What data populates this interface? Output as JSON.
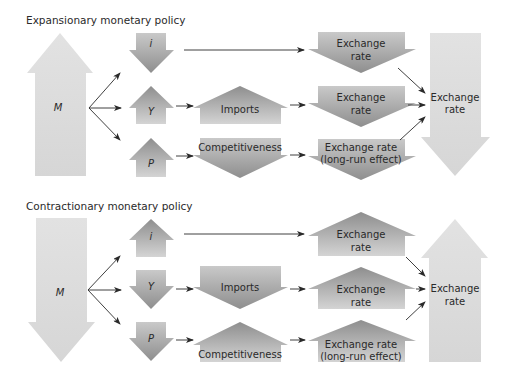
{
  "colors": {
    "light_arrow": "#d8d8d8",
    "dark_arrow_top": "#9a9a9a",
    "dark_arrow_bottom": "#cfcfcf",
    "line": "#2a2a2a",
    "text": "#2a2a2a"
  },
  "expansionary": {
    "title": "Expansionary monetary policy",
    "money": {
      "label": "M",
      "direction": "up"
    },
    "channels": [
      {
        "var": "i",
        "var_direction": "down",
        "intermediate": null,
        "intermediate_direction": null,
        "exchange_line1": "Exchange",
        "exchange_line2": "rate",
        "exchange_direction": "down"
      },
      {
        "var": "Y",
        "var_direction": "up",
        "intermediate": "Imports",
        "intermediate_direction": "up",
        "exchange_line1": "Exchange",
        "exchange_line2": "rate",
        "exchange_direction": "down"
      },
      {
        "var": "P",
        "var_direction": "up",
        "intermediate": "Competitiveness",
        "intermediate_direction": "down",
        "exchange_line1": "Exchange rate",
        "exchange_line2": "(long-run effect)",
        "exchange_direction": "down"
      }
    ],
    "result": {
      "line1": "Exchange",
      "line2": "rate",
      "direction": "down"
    }
  },
  "contractionary": {
    "title": "Contractionary monetary policy",
    "money": {
      "label": "M",
      "direction": "down"
    },
    "channels": [
      {
        "var": "i",
        "var_direction": "up",
        "intermediate": null,
        "intermediate_direction": null,
        "exchange_line1": "Exchange",
        "exchange_line2": "rate",
        "exchange_direction": "up"
      },
      {
        "var": "Y",
        "var_direction": "down",
        "intermediate": "Imports",
        "intermediate_direction": "down",
        "exchange_line1": "Exchange",
        "exchange_line2": "rate",
        "exchange_direction": "up"
      },
      {
        "var": "P",
        "var_direction": "down",
        "intermediate": "Competitiveness",
        "intermediate_direction": "up",
        "exchange_line1": "Exchange rate",
        "exchange_line2": "(long-run effect)",
        "exchange_direction": "up"
      }
    ],
    "result": {
      "line1": "Exchange",
      "line2": "rate",
      "direction": "up"
    }
  }
}
